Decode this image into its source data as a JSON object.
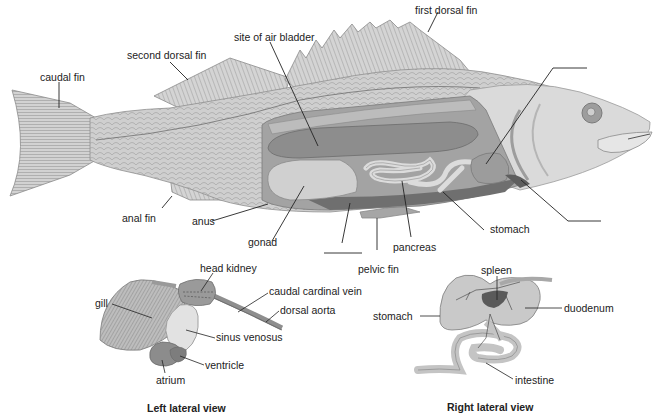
{
  "main_figure": {
    "labels": {
      "first_dorsal_fin": "first dorsal fin",
      "second_dorsal_fin": "second dorsal fin",
      "site_of_air_bladder": "site of air bladder",
      "caudal_fin": "caudal fin",
      "anal_fin": "anal fin",
      "anus": "anus",
      "gonad": "gonad",
      "pancreas": "pancreas",
      "pelvic_fin": "pelvic fin",
      "stomach": "stomach"
    },
    "blank_labels": [
      "heart (blank)",
      "liver (blank)",
      "intestine (blank)"
    ]
  },
  "left_view": {
    "caption": "Left lateral view",
    "labels": {
      "head_kidney": "head kidney",
      "caudal_cardinal_vein": "caudal cardinal vein",
      "dorsal_aorta": "dorsal aorta",
      "gill": "gill",
      "sinus_venosus": "sinus venosus",
      "ventricle": "ventricle",
      "atrium": "atrium"
    }
  },
  "right_view": {
    "caption": "Right lateral view",
    "labels": {
      "spleen": "spleen",
      "stomach": "stomach",
      "duodenum": "duodenum",
      "intestine": "intestine"
    }
  },
  "colors": {
    "ink": "#222222",
    "body_light": "#d9d9d9",
    "body_mid": "#b5b5b5",
    "body_dark": "#8a8a8a",
    "cavity": "#6f6f6f",
    "spleen": "#5a5a5a"
  }
}
